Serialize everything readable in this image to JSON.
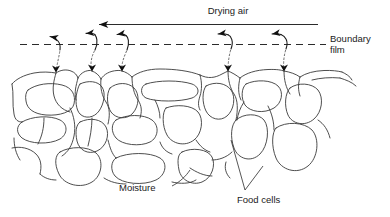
{
  "figure": {
    "title_text": "Drying air",
    "background_color": "#ffffff",
    "ink_color": "#2b2b2b",
    "width": 390,
    "height": 217
  },
  "labels": {
    "drying_air": "Drying air",
    "boundary_line1": "Boundary",
    "boundary_line2": "film",
    "moisture": "Moisture",
    "food_cells": "Food cells"
  },
  "annotations": {
    "air_flow_direction": "right-to-left",
    "vapor_arrow_count": 5,
    "boundary_style": "dashed"
  }
}
